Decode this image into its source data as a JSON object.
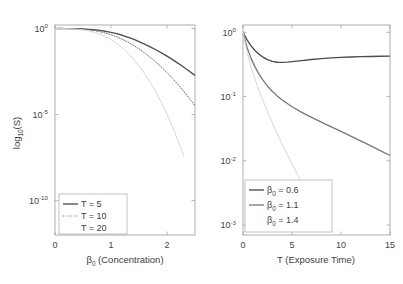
{
  "figure": {
    "background": "#ffffff",
    "panels": [
      "left",
      "right"
    ]
  },
  "colors": {
    "series_dark": "#4d4d4d",
    "series_mid": "#8c8c8c",
    "series_light": "#d8d8d8",
    "axis": "#9b9b9b",
    "text": "#3d3d3d"
  },
  "chart_data": [
    {
      "id": "left",
      "type": "line",
      "title": "",
      "xlabel": "β₀ (Concentration)",
      "xlabel_base": "β",
      "xlabel_sub": "0",
      "xlabel_rest": " (Concentration)",
      "ylabel": "log₁₀(S)",
      "ylabel_base": "log",
      "ylabel_sub": "10",
      "ylabel_rest": "(S)",
      "yscale": "log",
      "xlim": [
        0,
        2.5
      ],
      "ylim": [
        1e-12,
        1.6
      ],
      "grid": false,
      "legend_position": "lower-left",
      "xticks": [
        0,
        1,
        2
      ],
      "xticklabels": [
        "0",
        "1",
        "2"
      ],
      "yticks": [
        1,
        1e-05,
        1e-10
      ],
      "yticklabels": [
        {
          "base": "10",
          "exp": "0"
        },
        {
          "base": "10",
          "exp": "-5"
        },
        {
          "base": "10",
          "exp": "-10"
        }
      ],
      "series": [
        {
          "name": "T = 5",
          "label_base": "T = 5",
          "style": "solid",
          "color": "#4d4d4d",
          "x": [
            0,
            0.1,
            0.2,
            0.3,
            0.4,
            0.5,
            0.6,
            0.7,
            0.8,
            0.9,
            1.0,
            1.1,
            1.2,
            1.3,
            1.4,
            1.5,
            1.6,
            1.7,
            1.8,
            1.9,
            2.0,
            2.1,
            2.2,
            2.3,
            2.4,
            2.5
          ],
          "values": [
            1.0,
            0.999,
            0.995,
            0.985,
            0.968,
            0.94,
            0.9,
            0.845,
            0.775,
            0.69,
            0.6,
            0.5,
            0.405,
            0.315,
            0.238,
            0.175,
            0.125,
            0.0865,
            0.0585,
            0.0385,
            0.0248,
            0.0155,
            0.0095,
            0.00565,
            0.0033,
            0.00188
          ]
        },
        {
          "name": "T = 10",
          "label_base": "T = 10",
          "style": "dotted",
          "color": "#6f6f6f",
          "x": [
            0,
            0.1,
            0.2,
            0.3,
            0.4,
            0.5,
            0.6,
            0.7,
            0.8,
            0.9,
            1.0,
            1.1,
            1.2,
            1.3,
            1.4,
            1.5,
            1.6,
            1.7,
            1.8,
            1.9,
            2.0,
            2.1,
            2.2,
            2.3,
            2.4,
            2.5
          ],
          "values": [
            1.0,
            0.999,
            0.993,
            0.978,
            0.95,
            0.905,
            0.84,
            0.755,
            0.655,
            0.545,
            0.435,
            0.33,
            0.238,
            0.163,
            0.106,
            0.0655,
            0.0385,
            0.0215,
            0.0114,
            0.00575,
            0.00275,
            0.00125,
            0.00054,
            0.00022,
            8.6e-05,
            3.2e-05
          ]
        },
        {
          "name": "T = 20",
          "label_base": "T = 20",
          "style": "light",
          "color": "#d4d4d4",
          "x": [
            0,
            0.1,
            0.2,
            0.3,
            0.4,
            0.5,
            0.6,
            0.7,
            0.8,
            0.9,
            1.0,
            1.1,
            1.2,
            1.3,
            1.4,
            1.5,
            1.6,
            1.7,
            1.8,
            1.9,
            2.0,
            2.1,
            2.2,
            2.3
          ],
          "values": [
            1.0,
            0.998,
            0.988,
            0.962,
            0.912,
            0.835,
            0.73,
            0.605,
            0.468,
            0.338,
            0.226,
            0.138,
            0.0765,
            0.0382,
            0.0171,
            0.0068,
            0.00241,
            0.00075,
            0.000205,
            4.9e-05,
            1.02e-05,
            1.85e-06,
            2.9e-07,
            3.9e-08
          ]
        }
      ],
      "legend": [
        {
          "label": "T = 5",
          "style": "solid",
          "color": "#4d4d4d"
        },
        {
          "label": "T = 10",
          "style": "dotted",
          "color": "#6f6f6f"
        },
        {
          "label": "T = 20",
          "style": "light",
          "color": "#d4d4d4"
        }
      ]
    },
    {
      "id": "right",
      "type": "line",
      "title": "",
      "xlabel": "T (Exposure Time)",
      "ylabel": "",
      "yscale": "log",
      "xlim": [
        0,
        15
      ],
      "ylim": [
        0.0007,
        1.3
      ],
      "grid": false,
      "legend_position": "lower-left",
      "xticks": [
        0,
        5,
        10,
        15
      ],
      "xticklabels": [
        "0",
        "5",
        "10",
        "15"
      ],
      "yticks": [
        1,
        0.1,
        0.01,
        0.001
      ],
      "yticklabels": [
        {
          "base": "10",
          "exp": "0"
        },
        {
          "base": "10",
          "exp": "-1"
        },
        {
          "base": "10",
          "exp": "-2"
        },
        {
          "base": "10",
          "exp": "-3"
        }
      ],
      "series": [
        {
          "name": "β₀ = 0.6",
          "label_base": "β",
          "label_sub": "0",
          "label_rest": " = 0.6",
          "style": "solid",
          "color": "#4d4d4d",
          "x": [
            0,
            0.4,
            0.8,
            1.2,
            1.6,
            2.0,
            2.5,
            3.0,
            3.5,
            4.0,
            4.5,
            5.0,
            6.0,
            7.0,
            8.0,
            9.0,
            10.0,
            11.0,
            12.0,
            13.0,
            14.0,
            15.0
          ],
          "values": [
            1.0,
            0.77,
            0.62,
            0.525,
            0.46,
            0.415,
            0.375,
            0.352,
            0.342,
            0.34,
            0.343,
            0.349,
            0.363,
            0.377,
            0.389,
            0.399,
            0.407,
            0.413,
            0.418,
            0.421,
            0.424,
            0.426
          ]
        },
        {
          "name": "β₀ = 1.1",
          "label_base": "β",
          "label_sub": "0",
          "label_rest": " = 1.1",
          "style": "solid",
          "color": "#7a7a7a",
          "x": [
            0,
            0.4,
            0.8,
            1.2,
            1.6,
            2.0,
            2.5,
            3.0,
            3.5,
            4.0,
            5.0,
            6.0,
            7.0,
            8.0,
            9.0,
            10.0,
            11.0,
            12.0,
            13.0,
            14.0,
            15.0
          ],
          "values": [
            1.0,
            0.59,
            0.4,
            0.295,
            0.228,
            0.183,
            0.145,
            0.12,
            0.102,
            0.0885,
            0.0693,
            0.0566,
            0.0473,
            0.0399,
            0.0338,
            0.0287,
            0.0243,
            0.0205,
            0.0172,
            0.0144,
            0.0121
          ]
        },
        {
          "name": "β₀ = 1.4",
          "label_base": "β",
          "label_sub": "0",
          "label_rest": " = 1.4",
          "style": "light",
          "color": "#d4d4d4",
          "x": [
            0,
            0.4,
            0.8,
            1.2,
            1.6,
            2.0,
            2.5,
            3.0,
            3.5,
            4.0,
            4.5,
            5.0,
            5.5,
            6.0,
            6.5,
            7.0,
            7.5,
            8.0
          ],
          "values": [
            1.0,
            0.5,
            0.295,
            0.19,
            0.128,
            0.0895,
            0.0578,
            0.0385,
            0.0262,
            0.0181,
            0.0127,
            0.00896,
            0.00638,
            0.00457,
            0.00329,
            0.00238,
            0.00173,
            0.00126
          ]
        }
      ],
      "legend": [
        {
          "label": "β₀ = 0.6",
          "style": "solid",
          "color": "#4d4d4d"
        },
        {
          "label": "β₀ = 1.1",
          "style": "solid",
          "color": "#7a7a7a"
        },
        {
          "label": "β₀ = 1.4",
          "style": "light",
          "color": "#d4d4d4"
        }
      ]
    }
  ]
}
